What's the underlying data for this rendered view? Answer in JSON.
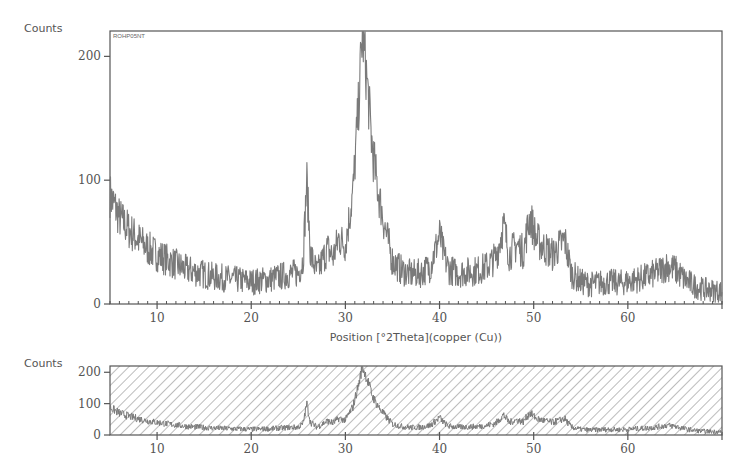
{
  "chart_data": [
    {
      "type": "line",
      "panel": "main",
      "sample_label": "ROHP05NT",
      "title": "",
      "xlabel": "Position [°2Theta](copper (Cu))",
      "ylabel": "Counts",
      "xlim": [
        5,
        70
      ],
      "ylim": [
        0,
        220
      ],
      "x_ticks": [
        10,
        20,
        30,
        40,
        50,
        60
      ],
      "y_ticks": [
        0,
        100,
        200
      ],
      "grid": false,
      "legend": null,
      "line_color": "#7a7a7a",
      "peaks": [
        {
          "x": 25.9,
          "y": 100
        },
        {
          "x": 28.1,
          "y": 45
        },
        {
          "x": 29.3,
          "y": 53
        },
        {
          "x": 31.8,
          "y": 220
        },
        {
          "x": 32.9,
          "y": 122
        },
        {
          "x": 34.2,
          "y": 62
        },
        {
          "x": 40.0,
          "y": 56
        },
        {
          "x": 46.8,
          "y": 64
        },
        {
          "x": 48.2,
          "y": 48
        },
        {
          "x": 49.6,
          "y": 71
        },
        {
          "x": 51.2,
          "y": 45
        },
        {
          "x": 53.3,
          "y": 52
        },
        {
          "x": 64.2,
          "y": 31
        }
      ],
      "series": [
        {
          "name": "ROHP05NT",
          "x": [
            5,
            6,
            7,
            8,
            9,
            10,
            11,
            12,
            13,
            14,
            15,
            16,
            17,
            18,
            19,
            20,
            21,
            22,
            23,
            24,
            25,
            25.5,
            25.9,
            26.3,
            27,
            28.1,
            28.7,
            29.3,
            30,
            30.8,
            31.4,
            31.8,
            32.3,
            32.9,
            33.5,
            34.2,
            35,
            36,
            37,
            38,
            39,
            39.6,
            40.0,
            40.5,
            41,
            42,
            43,
            44,
            45,
            46,
            46.8,
            47.4,
            48.2,
            48.9,
            49.6,
            50.3,
            51.2,
            52,
            53.3,
            54,
            55,
            56,
            57,
            58,
            59,
            60,
            61,
            62,
            63,
            64.2,
            65,
            66,
            67,
            68,
            69,
            70
          ],
          "y": [
            88,
            70,
            60,
            52,
            45,
            40,
            36,
            32,
            28,
            26,
            24,
            22,
            21,
            20,
            19,
            18,
            19,
            20,
            22,
            24,
            25,
            35,
            100,
            40,
            25,
            45,
            38,
            53,
            48,
            90,
            160,
            220,
            180,
            122,
            90,
            62,
            35,
            27,
            24,
            25,
            30,
            45,
            56,
            38,
            28,
            25,
            26,
            27,
            30,
            38,
            64,
            40,
            48,
            42,
            71,
            52,
            45,
            40,
            52,
            25,
            18,
            16,
            17,
            18,
            17,
            18,
            20,
            22,
            25,
            31,
            28,
            20,
            15,
            12,
            11,
            10
          ]
        }
      ]
    },
    {
      "type": "line",
      "panel": "overview",
      "ylabel": "Counts",
      "xlim": [
        5,
        70
      ],
      "ylim": [
        0,
        220
      ],
      "x_ticks": [
        10,
        20,
        30,
        40,
        50,
        60
      ],
      "y_ticks": [
        0,
        100,
        200
      ],
      "background_pattern": "diagonal-hatch",
      "series_ref": "ROHP05NT"
    }
  ],
  "labels": {
    "top_ylabel": "Counts",
    "bottom_ylabel": "Counts",
    "sample_tag": "ROHP05NT",
    "xlabel": "Position [°2Theta](copper (Cu))"
  },
  "colors": {
    "axis": "#555555",
    "trace": "#7a7a7a",
    "hatch": "#6b6b6b",
    "background": "#ffffff"
  }
}
